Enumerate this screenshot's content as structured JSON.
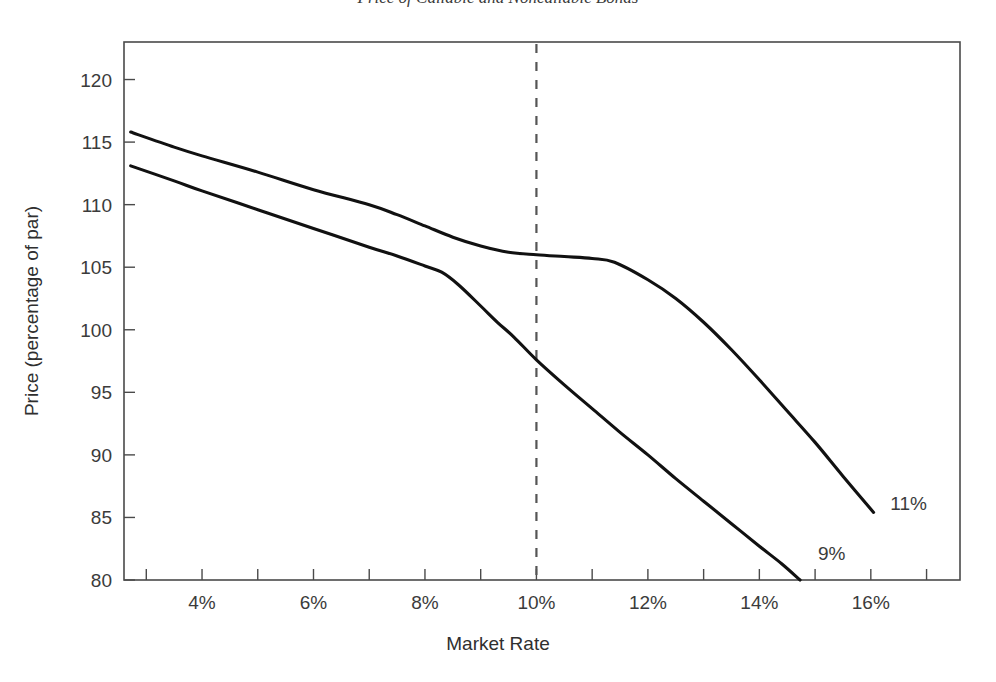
{
  "chart_data": {
    "type": "line",
    "title": "Price of Callable and Noncallable Bonds",
    "xlabel": "Market Rate",
    "ylabel": "Price (percentage of par)",
    "xlim": [
      2.6,
      17.6
    ],
    "ylim": [
      80,
      123
    ],
    "xticks": [
      3,
      4,
      5,
      6,
      7,
      8,
      9,
      10,
      11,
      12,
      13,
      14,
      15,
      16,
      17
    ],
    "xtick_labels": [
      "4%",
      "6%",
      "8%",
      "10%",
      "12%",
      "14%",
      "16%"
    ],
    "xtick_label_values": [
      4,
      6,
      8,
      10,
      12,
      14,
      16
    ],
    "yticks": [
      80,
      85,
      90,
      95,
      100,
      105,
      110,
      115,
      120
    ],
    "ytick_labels": [
      "120",
      "115",
      "110",
      "105",
      "100",
      "95",
      "90",
      "85",
      "80"
    ],
    "grid": false,
    "legend_position": "inline-end-labels",
    "annotations": [
      {
        "text": "11%",
        "x": 16.35,
        "y": 85.6
      },
      {
        "text": "9%",
        "x": 15.05,
        "y": 81.6
      }
    ],
    "reference_lines": [
      {
        "orientation": "vertical",
        "x": 10,
        "style": "dashed"
      }
    ],
    "series": [
      {
        "name": "11%",
        "label": "11%",
        "points": [
          [
            2.72,
            115.8
          ],
          [
            3.5,
            114.6
          ],
          [
            4.0,
            113.9
          ],
          [
            5.0,
            112.6
          ],
          [
            6.0,
            111.2
          ],
          [
            7.0,
            110.0
          ],
          [
            7.5,
            109.2
          ],
          [
            8.0,
            108.3
          ],
          [
            8.5,
            107.4
          ],
          [
            9.0,
            106.7
          ],
          [
            9.5,
            106.2
          ],
          [
            10.0,
            106.0
          ],
          [
            10.5,
            105.85
          ],
          [
            11.0,
            105.7
          ],
          [
            11.4,
            105.4
          ],
          [
            12.0,
            104.0
          ],
          [
            12.5,
            102.5
          ],
          [
            13.0,
            100.6
          ],
          [
            13.5,
            98.4
          ],
          [
            14.0,
            96.0
          ],
          [
            14.5,
            93.5
          ],
          [
            15.0,
            91.0
          ],
          [
            15.5,
            88.3
          ],
          [
            16.05,
            85.4
          ]
        ]
      },
      {
        "name": "9%",
        "label": "9%",
        "points": [
          [
            2.72,
            113.1
          ],
          [
            3.5,
            111.9
          ],
          [
            4.0,
            111.1
          ],
          [
            5.0,
            109.6
          ],
          [
            6.0,
            108.1
          ],
          [
            7.0,
            106.6
          ],
          [
            7.5,
            105.9
          ],
          [
            8.0,
            105.1
          ],
          [
            8.3,
            104.6
          ],
          [
            8.6,
            103.6
          ],
          [
            9.0,
            101.9
          ],
          [
            9.3,
            100.6
          ],
          [
            9.6,
            99.4
          ],
          [
            10.0,
            97.6
          ],
          [
            10.5,
            95.6
          ],
          [
            11.0,
            93.7
          ],
          [
            11.5,
            91.8
          ],
          [
            12.0,
            90.0
          ],
          [
            12.5,
            88.1
          ],
          [
            13.0,
            86.3
          ],
          [
            13.5,
            84.5
          ],
          [
            14.0,
            82.7
          ],
          [
            14.4,
            81.3
          ],
          [
            14.73,
            80.0
          ]
        ]
      }
    ]
  }
}
